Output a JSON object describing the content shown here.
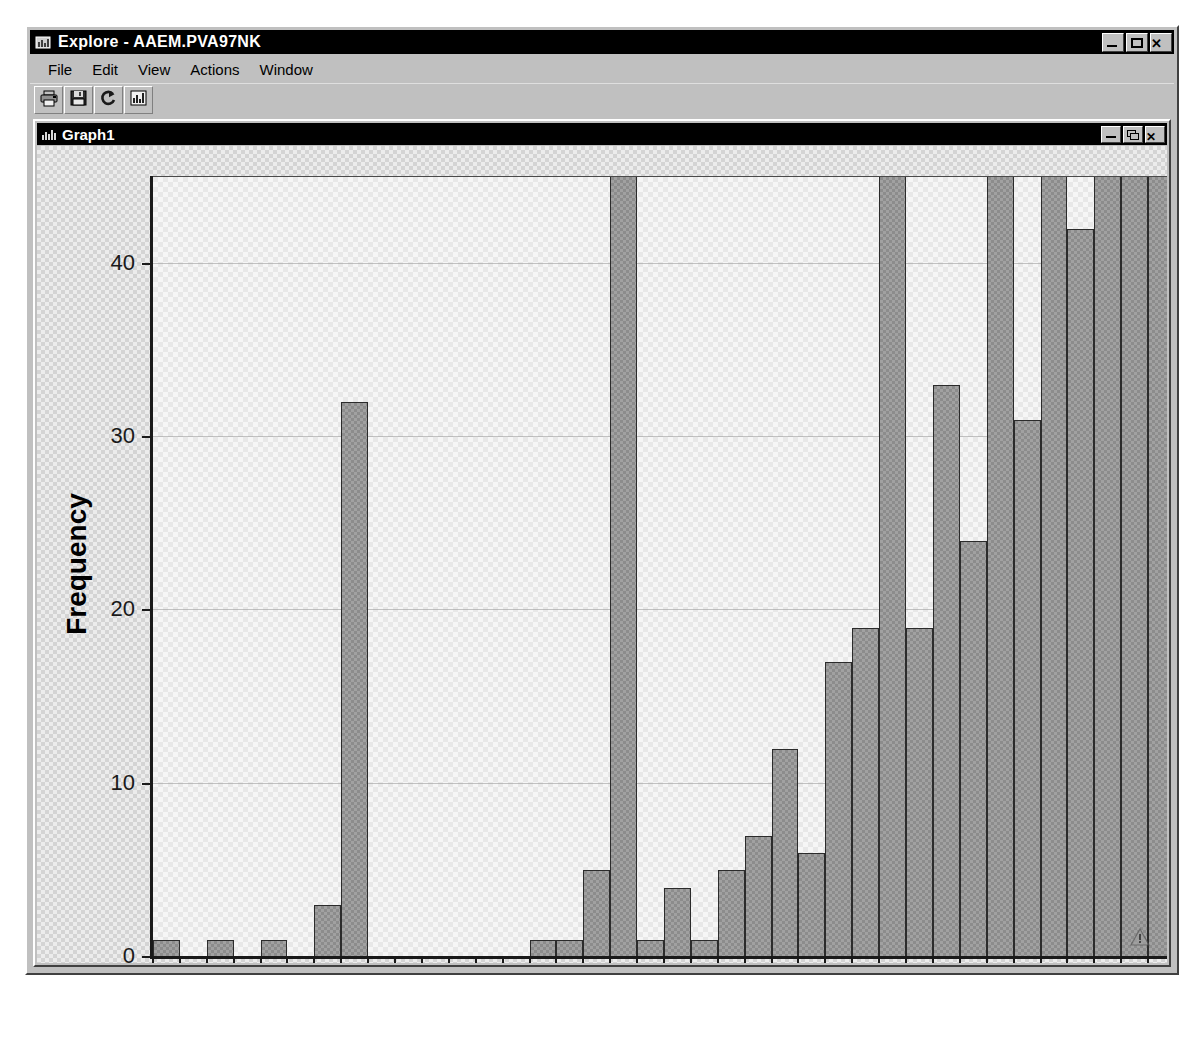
{
  "window": {
    "title": "Explore - AAEM.PVA97NK",
    "title_icon": "explore-icon",
    "controls": [
      {
        "name": "minimize-button",
        "icon": "minimize-icon",
        "label": "_"
      },
      {
        "name": "maximize-button",
        "icon": "maximize-icon",
        "label": "□"
      },
      {
        "name": "close-button",
        "icon": "close-icon",
        "label": "✕"
      }
    ]
  },
  "menubar": {
    "items": [
      {
        "label": "File",
        "name": "menu-file"
      },
      {
        "label": "Edit",
        "name": "menu-edit"
      },
      {
        "label": "View",
        "name": "menu-view"
      },
      {
        "label": "Actions",
        "name": "menu-actions"
      },
      {
        "label": "Window",
        "name": "menu-window"
      }
    ]
  },
  "toolbar": {
    "buttons": [
      {
        "name": "print-button",
        "icon": "printer-icon"
      },
      {
        "name": "save-button",
        "icon": "floppy-disk-icon"
      },
      {
        "name": "refresh-button",
        "icon": "refresh-icon"
      },
      {
        "name": "chart-button",
        "icon": "bar-chart-icon"
      }
    ]
  },
  "mdi": {
    "title": "Graph1",
    "title_icon": "bar-chart-icon",
    "controls": [
      {
        "name": "mdi-minimize-button",
        "icon": "minimize-icon",
        "label": "_"
      },
      {
        "name": "mdi-restore-button",
        "icon": "restore-icon",
        "label": "❐"
      },
      {
        "name": "mdi-close-button",
        "icon": "close-icon",
        "label": "✕"
      }
    ]
  },
  "status": {
    "warning_icon": "warning-triangle-icon"
  },
  "colors": {
    "bar_fill": "#8c8c8c",
    "bar_border": "#2b2b2b",
    "plot_background": "#e8e8e8",
    "canvas_background": "#d4d4d4",
    "window_chrome": "#c0c0c0",
    "titlebar": "#000000",
    "axis": "#1a1a1a"
  },
  "chart_data": {
    "type": "bar",
    "title": "",
    "xlabel": "Age",
    "ylabel": "Frequency",
    "xlim": [
      0,
      38
    ],
    "ylim": [
      0,
      45
    ],
    "ytick_values": [
      0,
      10,
      20,
      30,
      40
    ],
    "ytick_labels": [
      "0",
      "10",
      "20",
      "30",
      "40"
    ],
    "xtick_values": [
      0,
      2,
      4,
      6,
      8,
      10,
      12,
      14,
      16,
      18,
      20,
      22,
      24,
      26,
      28,
      30,
      32,
      34,
      36
    ],
    "xtick_labels": [
      "0",
      "2",
      "4",
      "6",
      "8",
      "10",
      "12",
      "14",
      "16",
      "18",
      "20",
      "22",
      "24",
      "26",
      "28",
      "30",
      "32",
      "34",
      "36"
    ],
    "grid": true,
    "grid_axis": "y",
    "bin_width": 1,
    "clipped_above": 45,
    "bins": [
      {
        "x0": 0,
        "x1": 1,
        "value": 1
      },
      {
        "x0": 2,
        "x1": 3,
        "value": 1
      },
      {
        "x0": 4,
        "x1": 5,
        "value": 1
      },
      {
        "x0": 6,
        "x1": 7,
        "value": 3
      },
      {
        "x0": 7,
        "x1": 8,
        "value": 32
      },
      {
        "x0": 14,
        "x1": 15,
        "value": 1
      },
      {
        "x0": 15,
        "x1": 16,
        "value": 1
      },
      {
        "x0": 16,
        "x1": 17,
        "value": 5
      },
      {
        "x0": 17,
        "x1": 18,
        "value": 46,
        "clipped": true
      },
      {
        "x0": 18,
        "x1": 19,
        "value": 1
      },
      {
        "x0": 19,
        "x1": 20,
        "value": 4
      },
      {
        "x0": 20,
        "x1": 21,
        "value": 1
      },
      {
        "x0": 21,
        "x1": 22,
        "value": 5
      },
      {
        "x0": 22,
        "x1": 23,
        "value": 7
      },
      {
        "x0": 23,
        "x1": 24,
        "value": 12
      },
      {
        "x0": 24,
        "x1": 25,
        "value": 6
      },
      {
        "x0": 25,
        "x1": 26,
        "value": 17
      },
      {
        "x0": 26,
        "x1": 27,
        "value": 19
      },
      {
        "x0": 27,
        "x1": 28,
        "value": 46,
        "clipped": true
      },
      {
        "x0": 28,
        "x1": 29,
        "value": 19
      },
      {
        "x0": 29,
        "x1": 30,
        "value": 33
      },
      {
        "x0": 30,
        "x1": 31,
        "value": 24
      },
      {
        "x0": 31,
        "x1": 32,
        "value": 46,
        "clipped": true
      },
      {
        "x0": 32,
        "x1": 33,
        "value": 31
      },
      {
        "x0": 33,
        "x1": 34,
        "value": 46,
        "clipped": true
      },
      {
        "x0": 34,
        "x1": 35,
        "value": 42
      },
      {
        "x0": 35,
        "x1": 36,
        "value": 46,
        "clipped": true
      },
      {
        "x0": 36,
        "x1": 37,
        "value": 46,
        "clipped": true
      },
      {
        "x0": 37,
        "x1": 38,
        "value": 46,
        "clipped": true
      }
    ]
  }
}
